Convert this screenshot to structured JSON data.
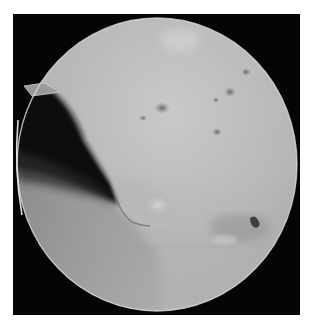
{
  "image": {
    "subject": "arthroscopic view",
    "modality": "grayscale endoscopic photograph",
    "colors": {
      "background": "#ffffff",
      "frame": "#050505",
      "tissue_light": "#c4c4c4",
      "tissue_mid": "#a8a8a8",
      "tissue_dark": "#8a8a8a",
      "shadow": "#0c0c0c",
      "rim_highlight": "#e8e8e8"
    },
    "regions": [
      {
        "name": "field-of-view-circle",
        "description": "circular scope view"
      },
      {
        "name": "instrument-tip",
        "description": "probe tip at upper-left edge"
      },
      {
        "name": "dark-cavity",
        "description": "dark shadowed recess at left"
      },
      {
        "name": "tissue-flap",
        "description": "irregular torn tissue flap in center"
      },
      {
        "name": "surface-spots",
        "description": "scattered dark spots on upper surface"
      },
      {
        "name": "lower-right-lesion",
        "description": "dark irregular spot at lower right"
      }
    ]
  }
}
